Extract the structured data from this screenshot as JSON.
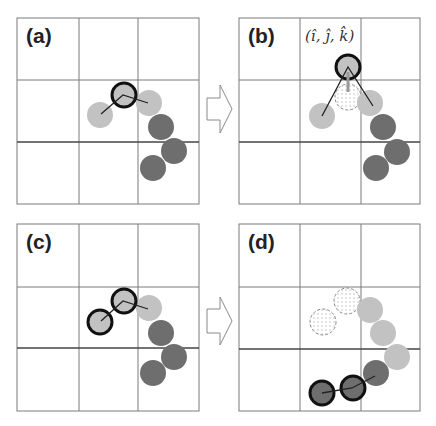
{
  "figure": {
    "width": 436,
    "height": 426,
    "colors": {
      "light_bead": "#c2c2c2",
      "dark_bead": "#6e6e6e",
      "highlight_stroke": "#111111",
      "ghost_stroke": "#8a8a8a",
      "ghost_dot": "#b5b5b5",
      "grid": "#7a7a7a",
      "grid_mid": "#444444",
      "bond": "#222222",
      "arrow_stroke": "#8a8a8a",
      "pushing_arrow": "#9a9a9a"
    },
    "bead_radius": 13,
    "panels": [
      {
        "id": "a",
        "label": "(a)",
        "box": {
          "x": 17,
          "y": 18,
          "w": 182,
          "h": 186
        },
        "vlines": [
          79,
          138
        ],
        "hlines": [
          80,
          142
        ],
        "math_label": null,
        "beads": [
          {
            "x": 100,
            "y": 115,
            "type": "light",
            "highlight": false
          },
          {
            "x": 124,
            "y": 95,
            "type": "light",
            "highlight": true
          },
          {
            "x": 149,
            "y": 103,
            "type": "light",
            "highlight": false
          },
          {
            "x": 161,
            "y": 127,
            "type": "dark",
            "highlight": false
          },
          {
            "x": 174,
            "y": 151,
            "type": "dark",
            "highlight": false
          },
          {
            "x": 153,
            "y": 168,
            "type": "dark",
            "highlight": false
          }
        ],
        "ghosts": [],
        "bonds": [
          [
            [
              101,
              114
            ],
            [
              123,
              95
            ],
            [
              148,
              103
            ]
          ]
        ],
        "push_arrows": []
      },
      {
        "id": "b",
        "label": "(b)",
        "box": {
          "x": 239,
          "y": 18,
          "w": 181,
          "h": 186
        },
        "vlines": [
          300,
          361
        ],
        "hlines": [
          80,
          142
        ],
        "math_label": {
          "text": "(î, ĵ, k̂)",
          "x": 305,
          "y": 41
        },
        "beads": [
          {
            "x": 322,
            "y": 116,
            "type": "light",
            "highlight": false
          },
          {
            "x": 348,
            "y": 67,
            "type": "light",
            "highlight": true
          },
          {
            "x": 370,
            "y": 103,
            "type": "light",
            "highlight": false
          },
          {
            "x": 383,
            "y": 127,
            "type": "dark",
            "highlight": false
          },
          {
            "x": 397,
            "y": 152,
            "type": "dark",
            "highlight": false
          },
          {
            "x": 376,
            "y": 168,
            "type": "dark",
            "highlight": false
          }
        ],
        "ghosts": [
          {
            "x": 348,
            "y": 97
          }
        ],
        "bonds": [
          [
            [
              322,
              116
            ],
            [
              348,
              67
            ],
            [
              373,
              106
            ]
          ]
        ],
        "push_arrows": [
          {
            "x1": 348,
            "y1": 92,
            "x2": 348,
            "y2": 72
          }
        ]
      },
      {
        "id": "c",
        "label": "(c)",
        "box": {
          "x": 17,
          "y": 224,
          "w": 182,
          "h": 187
        },
        "vlines": [
          79,
          138
        ],
        "hlines": [
          287,
          348
        ],
        "math_label": null,
        "beads": [
          {
            "x": 100,
            "y": 322,
            "type": "light",
            "highlight": true
          },
          {
            "x": 124,
            "y": 301,
            "type": "light",
            "highlight": true
          },
          {
            "x": 149,
            "y": 308,
            "type": "light",
            "highlight": false
          },
          {
            "x": 161,
            "y": 333,
            "type": "dark",
            "highlight": false
          },
          {
            "x": 174,
            "y": 357,
            "type": "dark",
            "highlight": false
          },
          {
            "x": 153,
            "y": 373,
            "type": "dark",
            "highlight": false
          }
        ],
        "ghosts": [],
        "bonds": [
          [
            [
              101,
              321
            ],
            [
              123,
              301
            ],
            [
              148,
              309
            ]
          ]
        ],
        "push_arrows": []
      },
      {
        "id": "d",
        "label": "(d)",
        "box": {
          "x": 239,
          "y": 224,
          "w": 181,
          "h": 187
        },
        "vlines": [
          300,
          361
        ],
        "hlines": [
          287,
          349
        ],
        "math_label": null,
        "beads": [
          {
            "x": 370,
            "y": 310,
            "type": "light",
            "highlight": false
          },
          {
            "x": 383,
            "y": 333,
            "type": "light",
            "highlight": false
          },
          {
            "x": 397,
            "y": 357,
            "type": "light",
            "highlight": false
          },
          {
            "x": 376,
            "y": 373,
            "type": "dark",
            "highlight": false
          },
          {
            "x": 353,
            "y": 388,
            "type": "dark",
            "highlight": true
          },
          {
            "x": 322,
            "y": 393,
            "type": "dark",
            "highlight": true
          }
        ],
        "ghosts": [
          {
            "x": 323,
            "y": 322
          },
          {
            "x": 347,
            "y": 301
          }
        ],
        "bonds": [
          [
            [
              322,
              393
            ],
            [
              352,
              388
            ],
            [
              375,
              376
            ]
          ]
        ],
        "push_arrows": []
      }
    ],
    "arrows": [
      {
        "id": "arrow-a-to-b",
        "shaft_x0": 207,
        "shaft_x1": 220,
        "cy": 109,
        "shaft_half": 11,
        "head_half": 24,
        "tip_x": 232
      },
      {
        "id": "arrow-c-to-d",
        "shaft_x0": 207,
        "shaft_x1": 220,
        "cy": 321,
        "shaft_half": 12,
        "head_half": 24,
        "tip_x": 232
      }
    ]
  }
}
